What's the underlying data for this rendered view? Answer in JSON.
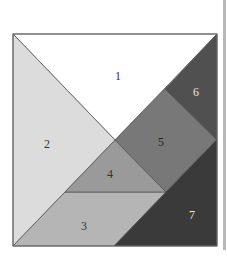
{
  "diagram": {
    "type": "tangram",
    "border_color": "#555555",
    "pieces": [
      {
        "id": "1",
        "label": "1",
        "color": "#ffffff",
        "text_color": "#333333",
        "points": "13,34 217,34 115,140",
        "label_pos": [
          118,
          80
        ]
      },
      {
        "id": "2",
        "label": "2",
        "color": "#dcdcdc",
        "text_color": "#333333",
        "points": "13,34 115,140 13,246",
        "label_pos": [
          47,
          148
        ]
      },
      {
        "id": "3",
        "label": "3",
        "color": "#b5b5b5",
        "text_color": "#333333",
        "points": "65,192 166,192 114,246 13,246",
        "label_pos": [
          84,
          230
        ]
      },
      {
        "id": "4",
        "label": "4",
        "color": "#9a9a9a",
        "text_color": "#333333",
        "points": "115,140 166,192 65,192",
        "label_pos": [
          110,
          178
        ]
      },
      {
        "id": "5",
        "label": "5",
        "color": "#787878",
        "text_color": "#222222",
        "points": "115,140 165,89 216,139 166,192",
        "label_pos": [
          161,
          146
        ]
      },
      {
        "id": "6",
        "label": "6",
        "color": "#505050",
        "text_color": "#e8e8e8",
        "points": "165,89 217,34 217,139 216,139",
        "label_pos": [
          196,
          96
        ]
      },
      {
        "id": "7",
        "label": "7",
        "color": "#3a3a3a",
        "text_color": "#e8e8e8",
        "points": "217,139 217,246 114,246 166,192",
        "label_pos": [
          192,
          219
        ]
      }
    ]
  }
}
